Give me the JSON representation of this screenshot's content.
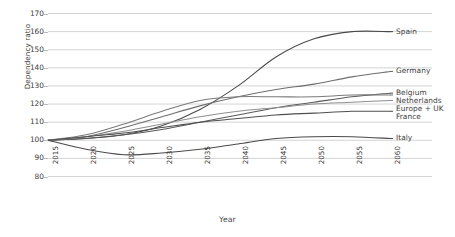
{
  "chart_data": {
    "type": "line",
    "title": "",
    "xlabel": "Year",
    "ylabel": "Dependency ratio",
    "grid": true,
    "legend_position": "right-of-plot-inline",
    "x": [
      2015,
      2020,
      2025,
      2030,
      2035,
      2040,
      2045,
      2050,
      2055,
      2060
    ],
    "xtick_labels": [
      "2015",
      "2020",
      "2025",
      "2030",
      "2035",
      "2040",
      "2045",
      "2050",
      "2055",
      "2060"
    ],
    "xlim": [
      2015,
      2060
    ],
    "ylim": [
      80,
      170
    ],
    "ytick_labels": [
      "80",
      "90",
      "100",
      "110",
      "120",
      "130",
      "140",
      "150",
      "160",
      "170"
    ],
    "ytick_values": [
      80,
      90,
      100,
      110,
      120,
      130,
      140,
      150,
      160,
      170
    ],
    "series": [
      {
        "name": "Spain",
        "color": "#4a4a4a",
        "values": [
          100,
          101,
          103,
          108,
          117,
          130,
          146,
          156,
          160,
          160
        ]
      },
      {
        "name": "Germany",
        "color": "#6e6e6e",
        "values": [
          100,
          102,
          107,
          113,
          119,
          124,
          128,
          131,
          135,
          138
        ]
      },
      {
        "name": "Belgium",
        "color": "#5a5a5a",
        "values": [
          100,
          101,
          103,
          106,
          110,
          114,
          118,
          121,
          124,
          126
        ]
      },
      {
        "name": "Netherlands",
        "color": "#7a7a7a",
        "values": [
          100,
          103,
          109,
          116,
          122,
          124,
          124,
          124,
          125,
          125
        ]
      },
      {
        "name": "Europe + UK",
        "color": "#8f8f8f",
        "values": [
          100,
          102,
          105,
          109,
          113,
          116,
          118,
          120,
          121,
          122
        ]
      },
      {
        "name": "France",
        "color": "#4f4f4f",
        "values": [
          100,
          102,
          104,
          107,
          110,
          112,
          114,
          115,
          116,
          116
        ]
      },
      {
        "name": "Italy",
        "color": "#4a4a4a",
        "values": [
          100,
          95,
          92,
          93,
          95,
          98,
          101,
          102,
          102,
          101
        ]
      }
    ]
  },
  "axes": {
    "y_title": "Dependency ratio",
    "x_title": "Year"
  }
}
